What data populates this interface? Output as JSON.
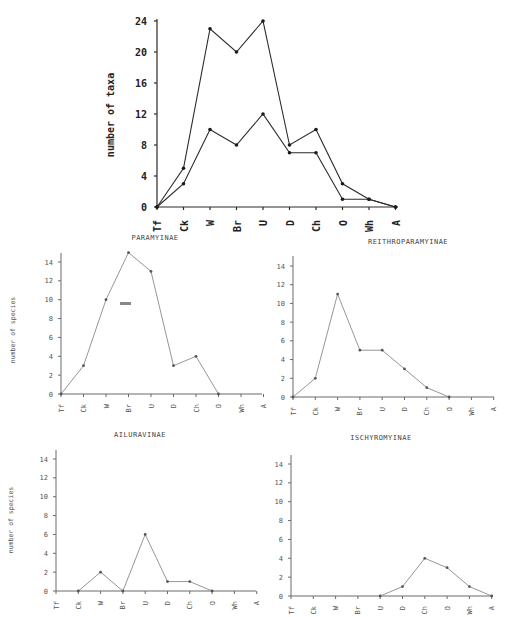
{
  "chart_data": [
    {
      "id": "total",
      "type": "line",
      "title": "",
      "xlabel": "",
      "ylabel": "number of taxa",
      "categories": [
        "Tf",
        "Ck",
        "W",
        "Br",
        "U",
        "D",
        "Ch",
        "O",
        "Wh",
        "A"
      ],
      "ylim": [
        0,
        24
      ],
      "yticks": [
        0,
        4,
        8,
        12,
        16,
        20,
        24
      ],
      "grid": false,
      "series": [
        {
          "name": "upper",
          "values": [
            0,
            5,
            23,
            20,
            24,
            8,
            10,
            3,
            1,
            0
          ]
        },
        {
          "name": "lower",
          "values": [
            0,
            3,
            10,
            8,
            12,
            7,
            7,
            1,
            1,
            0
          ]
        }
      ]
    },
    {
      "id": "paramyinae",
      "type": "line",
      "title": "PARAMYINAE",
      "xlabel": "",
      "ylabel": "number of species",
      "categories": [
        "Tf",
        "Ck",
        "W",
        "Br",
        "U",
        "D",
        "Ch",
        "O",
        "Wh",
        "A"
      ],
      "ylim": [
        0,
        15
      ],
      "yticks": [
        0,
        2,
        4,
        6,
        8,
        10,
        12,
        14
      ],
      "grid": false,
      "series": [
        {
          "name": "Paramyinae",
          "values": [
            0,
            3,
            10,
            15,
            13,
            3,
            4,
            0,
            null,
            null
          ]
        }
      ]
    },
    {
      "id": "reithroparamyinae",
      "type": "line",
      "title": "REITHROPARAMYINAE",
      "xlabel": "",
      "ylabel": "",
      "categories": [
        "Tf",
        "Ck",
        "W",
        "Br",
        "U",
        "D",
        "Ch",
        "O",
        "Wh",
        "A"
      ],
      "ylim": [
        0,
        15
      ],
      "yticks": [
        0,
        2,
        4,
        6,
        8,
        10,
        12,
        14
      ],
      "grid": false,
      "series": [
        {
          "name": "Reithroparamyinae",
          "values": [
            0,
            2,
            11,
            5,
            5,
            3,
            1,
            0,
            null,
            null
          ]
        }
      ]
    },
    {
      "id": "ailuravinae",
      "type": "line",
      "title": "AILURAVINAE",
      "xlabel": "",
      "ylabel": "number of species",
      "categories": [
        "Tf",
        "Ck",
        "W",
        "Br",
        "U",
        "D",
        "Ch",
        "O",
        "Wh",
        "A"
      ],
      "ylim": [
        0,
        15
      ],
      "yticks": [
        0,
        2,
        4,
        6,
        8,
        10,
        12,
        14
      ],
      "grid": false,
      "series": [
        {
          "name": "Ailuravinae",
          "values": [
            null,
            0,
            2,
            0,
            6,
            1,
            1,
            0,
            null,
            null
          ]
        }
      ]
    },
    {
      "id": "ischyromyinae",
      "type": "line",
      "title": "ISCHYROMYINAE",
      "xlabel": "",
      "ylabel": "",
      "categories": [
        "Tf",
        "Ck",
        "W",
        "Br",
        "U",
        "D",
        "Ch",
        "O",
        "Wh",
        "A"
      ],
      "ylim": [
        0,
        15
      ],
      "yticks": [
        0,
        2,
        4,
        6,
        8,
        10,
        12,
        14
      ],
      "grid": false,
      "series": [
        {
          "name": "Ischyromyinae",
          "values": [
            null,
            null,
            null,
            null,
            0,
            1,
            4,
            3,
            1,
            0
          ]
        }
      ]
    }
  ],
  "tick_labels": {
    "total": [
      "0",
      "4",
      "8",
      "12",
      "16",
      "20",
      "24"
    ],
    "small": [
      "0",
      "2",
      "4",
      "6",
      "8",
      "10",
      "12",
      "14"
    ]
  }
}
